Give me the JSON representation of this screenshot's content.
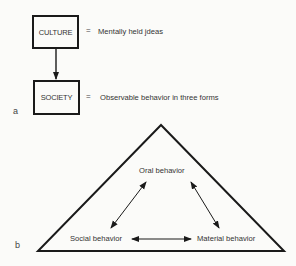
{
  "panel_a": {
    "label": "a",
    "culture_box": "CULTURE",
    "culture_eq": "=",
    "culture_def": "Mentally held jdeas",
    "society_box": "SOCIETY",
    "society_eq": "=",
    "society_def": "Observable behavior in three forms"
  },
  "panel_b": {
    "label": "b",
    "nodes": {
      "top": "Oral behavior",
      "left": "Social behavior",
      "right": "Material behavior"
    }
  }
}
